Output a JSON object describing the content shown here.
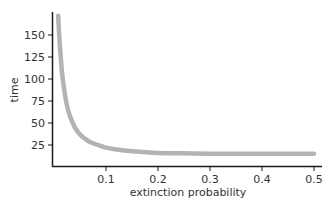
{
  "chart_data": {
    "type": "line",
    "title": "",
    "xlabel": "extinction probability",
    "ylabel": "time",
    "xlim": [
      0,
      0.5
    ],
    "ylim": [
      0,
      175
    ],
    "grid": false,
    "legend": null,
    "x_ticks": [
      "0.1",
      "0.2",
      "0.3",
      "0.4",
      "0.5"
    ],
    "y_ticks": [
      "25",
      "50",
      "75",
      "100",
      "125",
      "150"
    ],
    "series": [
      {
        "name": "time vs extinction probability",
        "color": "#b3b3b3",
        "x": [
          0.008,
          0.01,
          0.015,
          0.02,
          0.025,
          0.03,
          0.04,
          0.05,
          0.06,
          0.07,
          0.08,
          0.1,
          0.12,
          0.15,
          0.2,
          0.25,
          0.3,
          0.35,
          0.4,
          0.45,
          0.5
        ],
        "y": [
          172,
          150,
          110,
          86,
          70,
          59,
          45,
          37,
          32,
          28,
          26,
          22,
          20,
          18,
          16,
          15.5,
          15,
          15,
          15,
          15,
          15
        ]
      }
    ]
  },
  "axes": {
    "xlabel": "extinction probability",
    "ylabel": "time",
    "x_ticks": [
      {
        "label": "0.1",
        "value": 0.1
      },
      {
        "label": "0.2",
        "value": 0.2
      },
      {
        "label": "0.3",
        "value": 0.3
      },
      {
        "label": "0.4",
        "value": 0.4
      },
      {
        "label": "0.5",
        "value": 0.5
      }
    ],
    "y_ticks": [
      {
        "label": "25",
        "value": 25
      },
      {
        "label": "50",
        "value": 50
      },
      {
        "label": "75",
        "value": 75
      },
      {
        "label": "100",
        "value": 100
      },
      {
        "label": "125",
        "value": 125
      },
      {
        "label": "150",
        "value": 150
      }
    ]
  }
}
